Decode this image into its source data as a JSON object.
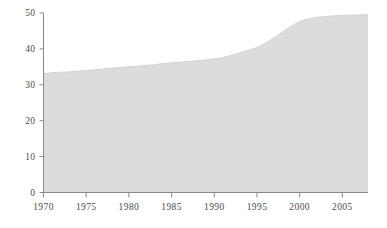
{
  "chart_data": {
    "type": "area",
    "title": "",
    "subtitle": "",
    "xlabel": "",
    "ylabel": "",
    "xlim": [
      1970,
      2008
    ],
    "ylim": [
      0,
      50
    ],
    "grid": false,
    "legend": null,
    "fill_color": "#dcdcdc",
    "line_color": "#d2d2d2",
    "axis_color": "#8a8a8a",
    "tick_label_color": "#4a4a4a",
    "background_color": "#ffffff",
    "y_ticks": [
      0,
      10,
      20,
      30,
      40,
      50
    ],
    "y_tick_labels": [
      "0",
      "10",
      "20",
      "30",
      "40",
      "50"
    ],
    "x_ticks": [
      1970,
      1975,
      1980,
      1985,
      1990,
      1995,
      2000,
      2005
    ],
    "x_tick_labels": [
      "1970",
      "1975",
      "1980",
      "1985",
      "1990",
      "1995",
      "2000",
      "2005"
    ],
    "x": [
      1970,
      1971,
      1972,
      1973,
      1974,
      1975,
      1976,
      1977,
      1978,
      1979,
      1980,
      1981,
      1982,
      1983,
      1984,
      1985,
      1986,
      1987,
      1988,
      1989,
      1990,
      1991,
      1992,
      1993,
      1994,
      1995,
      1996,
      1997,
      1998,
      1999,
      2000,
      2001,
      2002,
      2003,
      2004,
      2005,
      2006,
      2007,
      2008
    ],
    "values": [
      33.2,
      33.3,
      33.5,
      33.6,
      33.8,
      34.0,
      34.2,
      34.4,
      34.6,
      34.8,
      35.0,
      35.2,
      35.4,
      35.6,
      35.9,
      36.1,
      36.3,
      36.5,
      36.7,
      36.9,
      37.2,
      37.6,
      38.2,
      38.9,
      39.6,
      40.4,
      41.6,
      43.1,
      44.7,
      46.3,
      47.6,
      48.3,
      48.8,
      49.0,
      49.2,
      49.3,
      49.4,
      49.5,
      49.5
    ],
    "series": [
      {
        "name": "series-1",
        "values": [
          33.2,
          33.3,
          33.5,
          33.6,
          33.8,
          34.0,
          34.2,
          34.4,
          34.6,
          34.8,
          35.0,
          35.2,
          35.4,
          35.6,
          35.9,
          36.1,
          36.3,
          36.5,
          36.7,
          36.9,
          37.2,
          37.6,
          38.2,
          38.9,
          39.6,
          40.4,
          41.6,
          43.1,
          44.7,
          46.3,
          47.6,
          48.3,
          48.8,
          49.0,
          49.2,
          49.3,
          49.4,
          49.5,
          49.5
        ]
      }
    ]
  }
}
